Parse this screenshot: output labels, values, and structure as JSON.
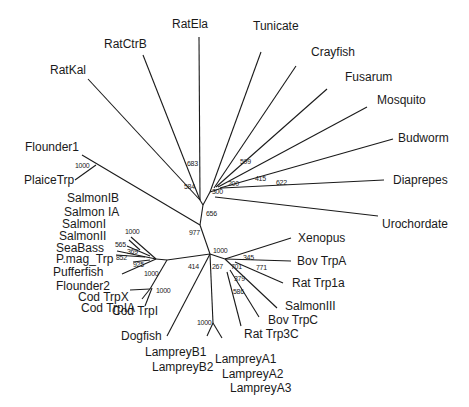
{
  "diagram": {
    "type": "unrooted phylogenetic tree",
    "leaves": {
      "ratela": "RatEla",
      "tunicate": "Tunicate",
      "ratctrb": "RatCtrB",
      "crayfish": "Crayfish",
      "fusarum": "Fusarum",
      "ratkal": "RatKal",
      "mosquito": "Mosquito",
      "budworm": "Budworm",
      "flounder1": "Flounder1",
      "plaicetrp": "PlaiceTrp",
      "diaprepes": "Diaprepes",
      "salmonib": "SalmonIB",
      "salmonia": "Salmon IA",
      "urochordate": "Urochordate",
      "salmoni": "SalmonI",
      "salmonii": "SalmonII",
      "seabass": "SeaBass",
      "xenopus": "Xenopus",
      "pmag": "P.mag_Trp",
      "bovtrpa": "Bov TrpA",
      "pufferfish": "Pufferfish",
      "rattrp1a": "Rat Trp1a",
      "flounder2": "Flounder2",
      "codtrpx": "Cod TrpX",
      "codtrpia": "Cod TrpIA",
      "salmoniii": "SalmonIII",
      "bovtrpc": "Bov TrpC",
      "codtrpi": "Cod TrpI",
      "rattrp3c": "Rat Trp3C",
      "dogfish": "Dogfish",
      "lampreyb1": "LampreyB1",
      "lampreyb2": "LampreyB2",
      "lampreya1": "LampreyA1",
      "lampreya2": "LampreyA2",
      "lampreya3": "LampreyA3"
    },
    "bootstrap": {
      "b683": "683",
      "b584": "584",
      "b599": "599",
      "b300": "300",
      "b200": "200",
      "b415": "415",
      "b622": "622",
      "b656": "656",
      "b1000_flounder": "1000",
      "b977": "977",
      "b1000_salmon": "1000",
      "b565": "565",
      "b369": "369",
      "b852": "852",
      "b925": "925",
      "b1000_puffer": "1000",
      "b1000_cod": "1000",
      "b414": "414",
      "b1000_hub": "1000",
      "b267": "267",
      "b345": "345",
      "b701": "701",
      "b771": "771",
      "b379": "379",
      "b586": "586",
      "b1000_lamprey": "1000"
    }
  }
}
